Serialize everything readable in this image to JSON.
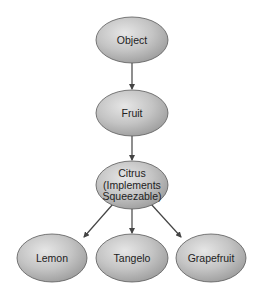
{
  "diagram": {
    "type": "class-hierarchy",
    "colors": {
      "background": "#ffffff",
      "node_fill_light": "#e6e6e6",
      "node_fill_mid": "#c4c4c4",
      "node_fill_dark": "#9c9c9c",
      "node_stroke": "#5a5a5a",
      "edge": "#444444",
      "text": "#222222"
    },
    "nodes": [
      {
        "id": "object",
        "lines": [
          "Object"
        ],
        "cx": 132,
        "cy": 40,
        "rx": 36,
        "ry": 23
      },
      {
        "id": "fruit",
        "lines": [
          "Fruit"
        ],
        "cx": 132,
        "cy": 113,
        "rx": 36,
        "ry": 23
      },
      {
        "id": "citrus",
        "lines": [
          "Citrus",
          "(Implements",
          "Squeezable)"
        ],
        "cx": 132,
        "cy": 185,
        "rx": 36,
        "ry": 24
      },
      {
        "id": "lemon",
        "lines": [
          "Lemon"
        ],
        "cx": 52,
        "cy": 258,
        "rx": 35,
        "ry": 24
      },
      {
        "id": "tangelo",
        "lines": [
          "Tangelo"
        ],
        "cx": 132,
        "cy": 258,
        "rx": 36,
        "ry": 24
      },
      {
        "id": "grapefruit",
        "lines": [
          "Grapefruit"
        ],
        "cx": 211,
        "cy": 258,
        "rx": 35,
        "ry": 24
      }
    ],
    "edges": [
      {
        "from": "object",
        "to": "fruit",
        "x1": 132,
        "y1": 63,
        "x2": 132,
        "y2": 89
      },
      {
        "from": "fruit",
        "to": "citrus",
        "x1": 132,
        "y1": 136,
        "x2": 132,
        "y2": 160
      },
      {
        "from": "citrus",
        "to": "lemon",
        "x1": 113,
        "y1": 204,
        "x2": 84,
        "y2": 237
      },
      {
        "from": "citrus",
        "to": "tangelo",
        "x1": 132,
        "y1": 209,
        "x2": 132,
        "y2": 233
      },
      {
        "from": "citrus",
        "to": "grapefruit",
        "x1": 151,
        "y1": 204,
        "x2": 181,
        "y2": 237
      }
    ]
  }
}
